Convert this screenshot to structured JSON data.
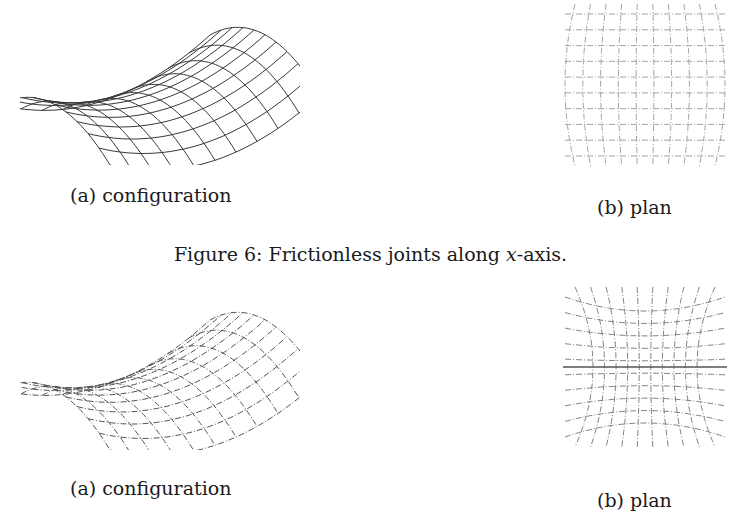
{
  "figures": [
    {
      "number": "6",
      "caption_prefix": "Figure 6: Frictionless joints along ",
      "caption_math": "x",
      "caption_suffix": "-axis.",
      "subfigures": [
        {
          "label": "(a) configuration",
          "type": "saddle-mesh",
          "line_color": "#3a3a3a",
          "dashed": false
        },
        {
          "label": "(b) plan",
          "type": "plan-grid",
          "line_color": "#9a9a9a",
          "dashed": true
        }
      ]
    },
    {
      "number": "7",
      "caption_prefix": "",
      "caption_math": "",
      "caption_suffix": "",
      "subfigures": [
        {
          "label": "(a) configuration",
          "type": "saddle-mesh",
          "line_color": "#555555",
          "dashed": true
        },
        {
          "label": "(b) plan",
          "type": "plan-grid-hourglass",
          "line_color": "#777777",
          "dashed": true
        }
      ]
    }
  ]
}
